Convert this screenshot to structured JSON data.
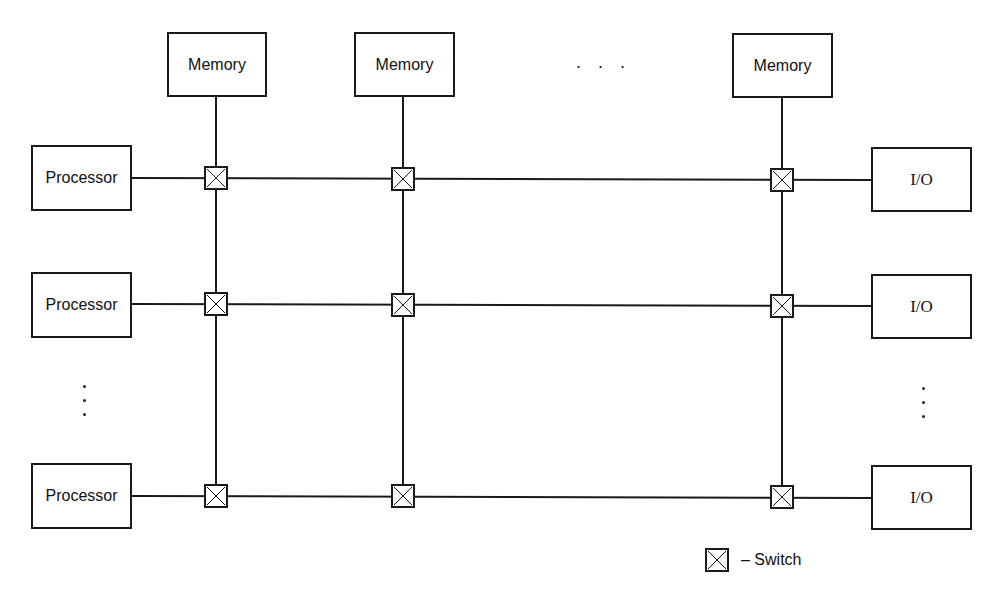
{
  "diagram": {
    "memory_labels": [
      "Memory",
      "Memory",
      "Memory"
    ],
    "memory_ellipsis": ". . .",
    "processor_labels": [
      "Processor",
      "Processor",
      "Processor"
    ],
    "io_labels": [
      "I/O",
      "I/O",
      "I/O"
    ],
    "legend": {
      "symbol": "switch-icon",
      "label": "– Switch"
    },
    "colors": {
      "line": "#1a1a1a",
      "background": "#ffffff"
    }
  }
}
